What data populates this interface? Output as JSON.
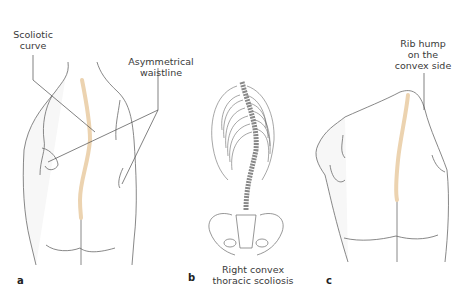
{
  "figure": {
    "panels": [
      {
        "letter": "a",
        "title": "Posterior view of back with scoliosis",
        "callouts": [
          {
            "text_line1": "Scoliotic",
            "text_line2": "curve"
          },
          {
            "text_line1": "Asymmetrical",
            "text_line2": "waistline"
          }
        ]
      },
      {
        "letter": "b",
        "caption_line1": "Right convex",
        "caption_line2": "thoracic scoliosis"
      },
      {
        "letter": "c",
        "callouts": [
          {
            "text_line1": "Rib hump",
            "text_line2": "on the",
            "text_line3": "convex side"
          }
        ]
      }
    ],
    "colors": {
      "outline": "#6a6a6a",
      "leader": "#4a4a4a",
      "spine_highlight": "#ecd3b0",
      "skin_fill": "#f7f7f7"
    }
  }
}
